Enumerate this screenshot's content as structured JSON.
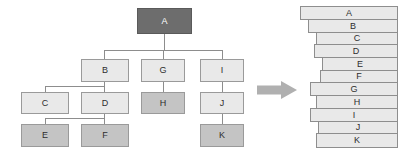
{
  "diagram": {
    "arrow": {
      "name": "right-arrow",
      "color": "#b0b0b0",
      "direction": "right"
    },
    "colors": {
      "root_fill": "#6d6d6d",
      "light_fill": "#e9e9e9",
      "mid_fill": "#c4c4c4",
      "border": "#9a9a9a",
      "edge": "#8d8d8d",
      "bar_fill": "#e9e9e9",
      "bar_border": "#8e8e8e"
    },
    "tree": {
      "nodes": [
        {
          "id": "A",
          "label": "A",
          "shade": "dark",
          "x": 137,
          "y": 8,
          "w": 55,
          "h": 26
        },
        {
          "id": "B",
          "label": "B",
          "shade": "light",
          "x": 81,
          "y": 59,
          "w": 48,
          "h": 23
        },
        {
          "id": "G",
          "label": "G",
          "shade": "light",
          "x": 141,
          "y": 59,
          "w": 44,
          "h": 23
        },
        {
          "id": "I",
          "label": "I",
          "shade": "light",
          "x": 200,
          "y": 59,
          "w": 44,
          "h": 23
        },
        {
          "id": "C",
          "label": "C",
          "shade": "light",
          "x": 21,
          "y": 92,
          "w": 48,
          "h": 22
        },
        {
          "id": "D",
          "label": "D",
          "shade": "light",
          "x": 81,
          "y": 92,
          "w": 48,
          "h": 22
        },
        {
          "id": "H",
          "label": "H",
          "shade": "mid",
          "x": 141,
          "y": 92,
          "w": 44,
          "h": 22
        },
        {
          "id": "J",
          "label": "J",
          "shade": "light",
          "x": 200,
          "y": 92,
          "w": 44,
          "h": 22
        },
        {
          "id": "E",
          "label": "E",
          "shade": "mid",
          "x": 21,
          "y": 124,
          "w": 48,
          "h": 23
        },
        {
          "id": "F",
          "label": "F",
          "shade": "mid",
          "x": 81,
          "y": 124,
          "w": 48,
          "h": 23
        },
        {
          "id": "K",
          "label": "K",
          "shade": "mid",
          "x": 200,
          "y": 124,
          "w": 44,
          "h": 23
        }
      ],
      "edges": [
        {
          "from": "A",
          "to": "B"
        },
        {
          "from": "A",
          "to": "G"
        },
        {
          "from": "A",
          "to": "I"
        },
        {
          "from": "B",
          "to": "C"
        },
        {
          "from": "B",
          "to": "D"
        },
        {
          "from": "D",
          "to": "E"
        },
        {
          "from": "D",
          "to": "F"
        },
        {
          "from": "G",
          "to": "H"
        },
        {
          "from": "I",
          "to": "J"
        },
        {
          "from": "J",
          "to": "K"
        }
      ]
    },
    "stack": {
      "right_edge": 398,
      "bars": [
        {
          "id": "A",
          "label": "A",
          "x": 300,
          "y": 6,
          "h": 14
        },
        {
          "id": "B",
          "label": "B",
          "x": 308,
          "y": 19,
          "h": 14
        },
        {
          "id": "C",
          "label": "C",
          "x": 316,
          "y": 32,
          "h": 13
        },
        {
          "id": "D",
          "label": "D",
          "x": 314,
          "y": 44,
          "h": 14
        },
        {
          "id": "E",
          "label": "E",
          "x": 322,
          "y": 57,
          "h": 14
        },
        {
          "id": "F",
          "label": "F",
          "x": 320,
          "y": 70,
          "h": 13
        },
        {
          "id": "G",
          "label": "G",
          "x": 310,
          "y": 82,
          "h": 14
        },
        {
          "id": "H",
          "label": "H",
          "x": 316,
          "y": 95,
          "h": 14
        },
        {
          "id": "I",
          "label": "I",
          "x": 310,
          "y": 108,
          "h": 14
        },
        {
          "id": "J",
          "label": "J",
          "x": 318,
          "y": 121,
          "h": 13
        },
        {
          "id": "K",
          "label": "K",
          "x": 316,
          "y": 133,
          "h": 15
        }
      ]
    }
  }
}
